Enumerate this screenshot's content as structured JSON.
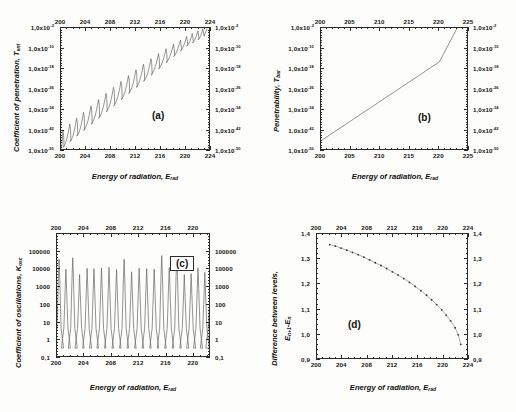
{
  "figure": {
    "background": "#fdfdfb",
    "axis_color": "#2b2b2b",
    "curve_color": "#555555",
    "panels": [
      "a",
      "b",
      "c",
      "d"
    ]
  },
  "common": {
    "xlabel_text": "Energy of radiation, E",
    "xlabel_sub": "rad",
    "mantissa": "1,0x10"
  },
  "panel_a": {
    "letter": "(a)",
    "ylabel_text": "Coefficient of penetration, T",
    "ylabel_sub": "ent",
    "xlabel_text": "Energy of radiation, E",
    "xlabel_sub": "rad",
    "xticks": [
      "200",
      "204",
      "208",
      "212",
      "216",
      "220",
      "224"
    ],
    "yticks": [
      "-2",
      "-10",
      "-18",
      "-26",
      "-34",
      "-42",
      "-50"
    ]
  },
  "panel_b": {
    "letter": "(b)",
    "ylabel_text": "Penetrability, T",
    "ylabel_sub": "bar",
    "xlabel_text": "Energy of radiation, E",
    "xlabel_sub": "rad",
    "xticks": [
      "200",
      "205",
      "210",
      "215",
      "220",
      "225"
    ],
    "yticks": [
      "-2",
      "-10",
      "-18",
      "-26",
      "-34",
      "-42",
      "-50"
    ]
  },
  "panel_c": {
    "letter": "(c)",
    "ylabel_text": "Coefficient of oscillations, K",
    "ylabel_sub": "osc",
    "xlabel_text": "Energy of radiation, E",
    "xlabel_sub": "rad",
    "xticks": [
      "200",
      "204",
      "208",
      "212",
      "216",
      "220"
    ],
    "yticks": [
      "100000",
      "10000",
      "1000",
      "100",
      "10",
      "1",
      "0,1"
    ]
  },
  "panel_d": {
    "letter": "(d)",
    "ylabel_line1": "Difference between levels,",
    "ylabel_e1": "E",
    "ylabel_e1_sub": "n+1",
    "ylabel_minus": "-E",
    "ylabel_e2_sub": "n",
    "xlabel_text": "Energy of radiation, E",
    "xlabel_sub": "rad",
    "xticks": [
      "200",
      "204",
      "208",
      "212",
      "216",
      "220",
      "224"
    ],
    "yticks": [
      "1,4",
      "1,3",
      "1,2",
      "1,1",
      "1,0",
      "0,9"
    ]
  },
  "chart_data": [
    {
      "type": "line",
      "panel": "a",
      "title": "(a)",
      "xlabel": "Energy of radiation, E_rad",
      "ylabel": "Coefficient of penetration, T_ent",
      "xlim": [
        200,
        224
      ],
      "ylim_log10": [
        -50,
        -2
      ],
      "yscale": "log",
      "grid": false,
      "description": "Monotonically rising log-linear trend with ~21 sharp resonance spikes (sawtooth) superposed",
      "baseline_x": [
        200,
        204,
        208,
        212,
        216,
        220,
        224
      ],
      "baseline_log10y": [
        -46.5,
        -38.5,
        -30.5,
        -22.5,
        -14.5,
        -6.5,
        -1.0
      ],
      "peak_positions": [
        200.3,
        201.4,
        202.5,
        203.6,
        204.8,
        206.0,
        207.2,
        208.4,
        209.6,
        210.8,
        212.0,
        213.2,
        214.4,
        215.6,
        216.8,
        218.0,
        219.1,
        220.1,
        221.0,
        221.9,
        222.7
      ],
      "peak_log10y": [
        -42.0,
        -39.5,
        -37.2,
        -34.9,
        -32.4,
        -29.9,
        -27.5,
        -25.1,
        -22.8,
        -20.5,
        -18.3,
        -16.1,
        -14.0,
        -12.0,
        -10.1,
        -8.3,
        -6.7,
        -5.3,
        -4.1,
        -3.1,
        -2.3
      ]
    },
    {
      "type": "line",
      "panel": "b",
      "title": "(b)",
      "xlabel": "Energy of radiation, E_rad",
      "ylabel": "Penetrability, T_bar",
      "xlim": [
        200,
        225
      ],
      "ylim_log10": [
        -50,
        -2
      ],
      "yscale": "log",
      "grid": false,
      "description": "Straight line in log space rising from 10^-46 at x=200 to 10^-2 at x=223",
      "x": [
        200,
        205,
        210,
        215,
        220,
        223
      ],
      "log10y": [
        -46.0,
        -38.3,
        -30.6,
        -22.9,
        -15.2,
        -2.0
      ]
    },
    {
      "type": "line",
      "panel": "c",
      "title": "(c)",
      "xlabel": "Energy of radiation, E_rad",
      "ylabel": "Coefficient of oscillations, K_osc",
      "xlim": [
        200,
        222.5
      ],
      "ylim": [
        0.1,
        100000
      ],
      "yscale": "log",
      "grid": false,
      "description": "21 narrow resonance peaks on a baseline near 0.3, peak heights vary between ~1000 and ~9000",
      "peak_positions": [
        200.3,
        201.3,
        202.3,
        203.3,
        204.4,
        205.4,
        206.5,
        207.6,
        208.7,
        209.8,
        210.9,
        212.0,
        213.1,
        214.2,
        215.3,
        216.4,
        217.5,
        218.6,
        219.6,
        220.6,
        221.6,
        222.4
      ],
      "peak_values": [
        6000,
        2000,
        7000,
        1100,
        2200,
        2100,
        2300,
        2400,
        1900,
        6000,
        1500,
        2200,
        2100,
        2000,
        9000,
        2400,
        8500,
        1100,
        1200,
        2300,
        1400,
        500
      ],
      "baseline_value": 0.3
    },
    {
      "type": "scatter-line",
      "panel": "d",
      "title": "(d)",
      "xlabel": "Energy of radiation, E_rad",
      "ylabel": "Difference between levels, E_n+1 - E_n",
      "xlim": [
        200,
        224
      ],
      "ylim": [
        0.9,
        1.4
      ],
      "grid": false,
      "description": "Monotonically decreasing concave curve of discrete markers",
      "x": [
        202.0,
        202.9,
        203.8,
        204.7,
        205.6,
        206.5,
        207.4,
        208.3,
        209.2,
        210.1,
        211.0,
        211.9,
        212.8,
        213.7,
        214.6,
        215.5,
        216.4,
        217.3,
        218.1,
        218.9,
        219.7,
        220.4,
        221.1,
        221.8,
        222.3,
        222.7
      ],
      "y": [
        1.358,
        1.352,
        1.344,
        1.336,
        1.327,
        1.318,
        1.308,
        1.297,
        1.286,
        1.275,
        1.263,
        1.25,
        1.237,
        1.223,
        1.208,
        1.192,
        1.175,
        1.157,
        1.139,
        1.12,
        1.099,
        1.078,
        1.055,
        1.028,
        1.0,
        0.962
      ]
    }
  ]
}
